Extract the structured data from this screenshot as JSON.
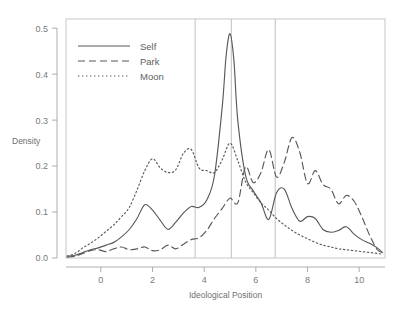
{
  "chart_data": {
    "type": "line",
    "title": "",
    "xlabel": "Ideological Position",
    "ylabel": "Density",
    "xlim": [
      -1.35,
      11.0
    ],
    "ylim": [
      0.0,
      0.52
    ],
    "grid": false,
    "legend_position": "top-left",
    "xticks": [
      0,
      2,
      4,
      6,
      8,
      10
    ],
    "xtick_labels": [
      "0",
      "2",
      "4",
      "6",
      "8",
      "10"
    ],
    "yticks": [
      0.0,
      0.1,
      0.2,
      0.3,
      0.4,
      0.5
    ],
    "ytick_labels": [
      "0.0",
      "0.1",
      "0.2",
      "0.3",
      "0.4",
      "0.5"
    ],
    "reference_lines": [
      {
        "x": 3.65,
        "label": "ref-line-1"
      },
      {
        "x": 5.05,
        "label": "ref-line-2"
      },
      {
        "x": 6.75,
        "label": "ref-line-3"
      }
    ],
    "series": [
      {
        "name": "Self",
        "dash": "solid",
        "x": [
          -1.3,
          -1.0,
          -0.7,
          -0.4,
          -0.1,
          0.2,
          0.5,
          0.8,
          1.1,
          1.4,
          1.7,
          2.0,
          2.3,
          2.6,
          2.9,
          3.2,
          3.5,
          3.8,
          4.1,
          4.4,
          4.7,
          4.85,
          5.0,
          5.15,
          5.3,
          5.6,
          5.9,
          6.2,
          6.5,
          6.8,
          7.1,
          7.4,
          7.7,
          8.0,
          8.3,
          8.6,
          8.9,
          9.2,
          9.5,
          9.8,
          10.1,
          10.4,
          10.7,
          10.9
        ],
        "y": [
          0.004,
          0.006,
          0.012,
          0.018,
          0.022,
          0.028,
          0.034,
          0.046,
          0.062,
          0.086,
          0.116,
          0.104,
          0.082,
          0.062,
          0.078,
          0.098,
          0.112,
          0.11,
          0.126,
          0.18,
          0.33,
          0.44,
          0.488,
          0.43,
          0.3,
          0.18,
          0.146,
          0.12,
          0.084,
          0.142,
          0.15,
          0.108,
          0.08,
          0.09,
          0.086,
          0.062,
          0.056,
          0.06,
          0.068,
          0.052,
          0.04,
          0.032,
          0.022,
          0.012
        ]
      },
      {
        "name": "Park",
        "dash": "dashed",
        "x": [
          -1.3,
          -1.0,
          -0.7,
          -0.4,
          -0.1,
          0.2,
          0.5,
          0.8,
          1.1,
          1.4,
          1.7,
          2.0,
          2.3,
          2.6,
          2.9,
          3.2,
          3.5,
          3.8,
          4.1,
          4.4,
          4.7,
          5.0,
          5.3,
          5.6,
          5.9,
          6.2,
          6.5,
          6.8,
          7.1,
          7.4,
          7.7,
          8.0,
          8.3,
          8.6,
          8.9,
          9.2,
          9.5,
          9.8,
          10.1,
          10.4,
          10.7,
          10.9
        ],
        "y": [
          0.002,
          0.004,
          0.01,
          0.016,
          0.018,
          0.014,
          0.02,
          0.024,
          0.018,
          0.02,
          0.024,
          0.016,
          0.018,
          0.028,
          0.02,
          0.03,
          0.04,
          0.044,
          0.06,
          0.086,
          0.108,
          0.13,
          0.12,
          0.198,
          0.164,
          0.186,
          0.236,
          0.176,
          0.208,
          0.262,
          0.23,
          0.162,
          0.19,
          0.16,
          0.15,
          0.118,
          0.136,
          0.124,
          0.09,
          0.05,
          0.018,
          0.012
        ]
      },
      {
        "name": "Moon",
        "dash": "dotted",
        "x": [
          -1.3,
          -1.0,
          -0.7,
          -0.4,
          -0.1,
          0.2,
          0.5,
          0.8,
          1.1,
          1.4,
          1.7,
          2.0,
          2.3,
          2.6,
          2.9,
          3.2,
          3.5,
          3.8,
          4.1,
          4.4,
          4.7,
          5.0,
          5.3,
          5.6,
          5.9,
          6.2,
          6.5,
          6.8,
          7.1,
          7.4,
          7.7,
          8.0,
          8.3,
          8.6,
          8.9,
          9.2,
          9.5,
          9.8,
          10.1,
          10.4,
          10.7,
          10.9
        ],
        "y": [
          0.004,
          0.01,
          0.022,
          0.032,
          0.044,
          0.058,
          0.072,
          0.09,
          0.11,
          0.148,
          0.19,
          0.216,
          0.196,
          0.186,
          0.192,
          0.228,
          0.236,
          0.196,
          0.19,
          0.186,
          0.214,
          0.25,
          0.212,
          0.166,
          0.142,
          0.12,
          0.104,
          0.086,
          0.072,
          0.06,
          0.05,
          0.042,
          0.034,
          0.028,
          0.024,
          0.02,
          0.018,
          0.016,
          0.014,
          0.012,
          0.01,
          0.008
        ]
      }
    ]
  },
  "style": {
    "line_color": "#595959",
    "axis_color": "#9a9a9a",
    "frame_color": "#b9b9b9",
    "vline_color": "#b0b0b0",
    "text_color": "#6f6f6f",
    "background": "#ffffff"
  },
  "top_artifact": {
    "text": "· · ·  · · ·· ·   · ·· · ·  · ·  ·· · · · ·  · · ·   · · ·  ·"
  }
}
